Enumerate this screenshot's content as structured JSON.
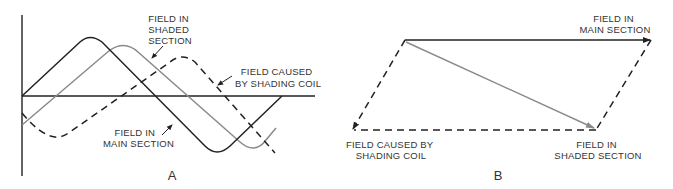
{
  "diagram_a": {
    "caption": "A",
    "labels": {
      "shaded": [
        "FIELD IN",
        "SHADED",
        "SECTION"
      ],
      "coil": [
        "FIELD CAUSED",
        "BY SHADING COIL"
      ],
      "main": [
        "FIELD IN",
        "MAIN SECTION"
      ]
    },
    "colors": {
      "main": "#222222",
      "shaded": "#8a8a8a",
      "coil": "#222222",
      "axis": "#222222"
    }
  },
  "diagram_b": {
    "caption": "B",
    "labels": {
      "main": [
        "FIELD IN",
        "MAIN SECTION"
      ],
      "coil": [
        "FIELD CAUSED BY",
        "SHADING COIL"
      ],
      "shaded": [
        "FIELD IN",
        "SHADED SECTION"
      ]
    },
    "colors": {
      "main": "#222222",
      "shaded": "#8a8a8a",
      "coil": "#222222"
    }
  }
}
